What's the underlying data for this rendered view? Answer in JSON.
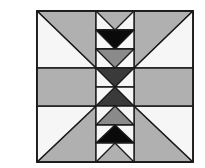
{
  "diagram": {
    "type": "quilt-block",
    "title": "",
    "canvas": {
      "width": 205,
      "height": 168,
      "background": "#ffffff"
    },
    "block": {
      "x": 37,
      "y": 11,
      "width": 156,
      "height": 151
    },
    "colors": {
      "white": "#f6f6f6",
      "light_gray": "#b0b0b0",
      "medium_gray": "#8a8a8a",
      "dark_gray": "#3a3a3a",
      "black": "#0a0a0a",
      "line": "#1a1a1a"
    },
    "grid": {
      "column_left": 96,
      "column_right": 134,
      "column_center": 115,
      "band_top": 68,
      "band_bottom": 106,
      "band_center": 87
    },
    "center_strip_rows": [
      {
        "y0": 11,
        "y1": 30,
        "shape": "down-triangle",
        "fill": "light_gray"
      },
      {
        "y0": 30,
        "y1": 49,
        "shape": "down-triangle",
        "fill": "black"
      },
      {
        "y0": 49,
        "y1": 68,
        "shape": "down-triangle",
        "fill": "medium_gray"
      },
      {
        "y0": 68,
        "y1": 87,
        "shape": "down-triangle",
        "fill": "dark_gray"
      },
      {
        "y0": 87,
        "y1": 106,
        "shape": "up-triangle",
        "fill": "dark_gray"
      },
      {
        "y0": 106,
        "y1": 125,
        "shape": "up-triangle",
        "fill": "medium_gray"
      },
      {
        "y0": 125,
        "y1": 143,
        "shape": "up-triangle",
        "fill": "black"
      },
      {
        "y0": 143,
        "y1": 162,
        "shape": "up-triangle",
        "fill": "light_gray"
      }
    ]
  }
}
